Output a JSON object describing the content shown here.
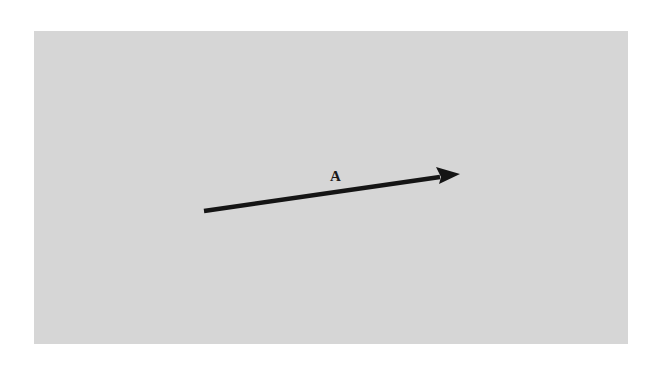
{
  "diagram": {
    "background_color": "#d6d6d6",
    "vector": {
      "label": "A",
      "color": "#151515",
      "start": [
        204,
        211
      ],
      "end": [
        460,
        174
      ]
    }
  }
}
